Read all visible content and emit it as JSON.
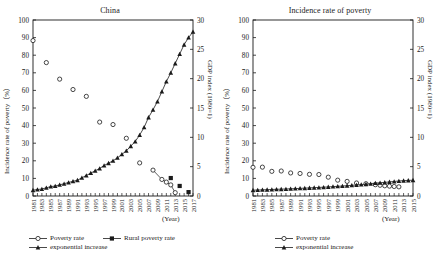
{
  "figure": {
    "background": "#ffffff",
    "axis_color": "#1a1a1a",
    "marker_color": "#1a1a1a"
  },
  "panels": [
    {
      "key": "china",
      "title": "China",
      "x_unit_label": "(Year)",
      "y_left_label": "Incidence rate of poverty（%）",
      "y_right_label": "GDP index (1980=1)",
      "legend": [
        {
          "label": "Poverty rate",
          "marker": "open-circle"
        },
        {
          "label": "Rural poverty rate",
          "marker": "filled-square"
        },
        {
          "label": "exponential increase",
          "marker": "filled-triangle"
        }
      ]
    },
    {
      "key": "incidence",
      "title": "Incidence rate of poverty",
      "x_unit_label": "(Year)",
      "y_left_label": "Incidence rate of poverty（%）",
      "y_right_label": "GDP index (1980=1)",
      "legend": [
        {
          "label": "Poverty rate",
          "marker": "open-circle"
        },
        {
          "label": "exponential increase",
          "marker": "filled-triangle"
        }
      ]
    }
  ],
  "chart_data": [
    {
      "type": "scatter",
      "title": "China",
      "xlabel": "(Year)",
      "ylabel": "Incidence rate of poverty（%）",
      "ylabel_right": "GDP index (1980=1)",
      "ylim": [
        0,
        100
      ],
      "ylim_right": [
        0,
        30
      ],
      "yticks": [
        0,
        10,
        20,
        30,
        40,
        50,
        60,
        70,
        80,
        90,
        100
      ],
      "yticks_right": [
        0,
        5,
        10,
        15,
        20,
        25,
        30
      ],
      "grid": false,
      "legend_position": "below-axes",
      "x": [
        1981,
        1982,
        1983,
        1984,
        1985,
        1986,
        1987,
        1988,
        1989,
        1990,
        1991,
        1992,
        1993,
        1994,
        1995,
        1996,
        1997,
        1998,
        1999,
        2000,
        2001,
        2002,
        2003,
        2004,
        2005,
        2006,
        2007,
        2008,
        2009,
        2010,
        2011,
        2012,
        2013,
        2014,
        2015,
        2016,
        2017
      ],
      "xtick_labels": [
        "1981",
        "1983",
        "1985",
        "1987",
        "1989",
        "1991",
        "1993",
        "1995",
        "1997",
        "1999",
        "2001",
        "2003",
        "2005",
        "2007",
        "2009",
        "2011",
        "2013",
        "2015",
        "2017"
      ],
      "series": [
        {
          "name": "Poverty rate",
          "marker": "open-circle",
          "axis": "left",
          "points": [
            {
              "x": 1981,
              "y": 88.3
            },
            {
              "x": 1984,
              "y": 75.8
            },
            {
              "x": 1987,
              "y": 66.4
            },
            {
              "x": 1990,
              "y": 60.5
            },
            {
              "x": 1993,
              "y": 56.6
            },
            {
              "x": 1996,
              "y": 42.0
            },
            {
              "x": 1999,
              "y": 40.6
            },
            {
              "x": 2002,
              "y": 32.8
            },
            {
              "x": 2005,
              "y": 18.8
            },
            {
              "x": 2008,
              "y": 14.7
            },
            {
              "x": 2010,
              "y": 9.4
            },
            {
              "x": 2011,
              "y": 7.9
            },
            {
              "x": 2012,
              "y": 6.3
            },
            {
              "x": 2013,
              "y": 1.9
            }
          ]
        },
        {
          "name": "Rural poverty rate",
          "marker": "filled-square",
          "axis": "left",
          "points": [
            {
              "x": 2012,
              "y": 10.2
            },
            {
              "x": 2014,
              "y": 5.7
            },
            {
              "x": 2016,
              "y": 2.2
            }
          ]
        },
        {
          "name": "exponential increase",
          "marker": "filled-triangle",
          "axis": "right",
          "points": [
            {
              "x": 1981,
              "y": 1.0
            },
            {
              "x": 1982,
              "y": 1.1
            },
            {
              "x": 1983,
              "y": 1.2
            },
            {
              "x": 1984,
              "y": 1.4
            },
            {
              "x": 1985,
              "y": 1.6
            },
            {
              "x": 1986,
              "y": 1.7
            },
            {
              "x": 1987,
              "y": 1.9
            },
            {
              "x": 1988,
              "y": 2.1
            },
            {
              "x": 1989,
              "y": 2.3
            },
            {
              "x": 1990,
              "y": 2.5
            },
            {
              "x": 1991,
              "y": 2.7
            },
            {
              "x": 1992,
              "y": 3.1
            },
            {
              "x": 1993,
              "y": 3.5
            },
            {
              "x": 1994,
              "y": 3.9
            },
            {
              "x": 1995,
              "y": 4.3
            },
            {
              "x": 1996,
              "y": 4.7
            },
            {
              "x": 1997,
              "y": 5.2
            },
            {
              "x": 1998,
              "y": 5.6
            },
            {
              "x": 1999,
              "y": 6.0
            },
            {
              "x": 2000,
              "y": 6.5
            },
            {
              "x": 2001,
              "y": 7.1
            },
            {
              "x": 2002,
              "y": 7.7
            },
            {
              "x": 2003,
              "y": 8.5
            },
            {
              "x": 2004,
              "y": 9.3
            },
            {
              "x": 2005,
              "y": 10.4
            },
            {
              "x": 2006,
              "y": 11.7
            },
            {
              "x": 2007,
              "y": 13.4
            },
            {
              "x": 2008,
              "y": 14.7
            },
            {
              "x": 2009,
              "y": 16.1
            },
            {
              "x": 2010,
              "y": 17.8
            },
            {
              "x": 2011,
              "y": 19.5
            },
            {
              "x": 2012,
              "y": 21.0
            },
            {
              "x": 2013,
              "y": 22.6
            },
            {
              "x": 2014,
              "y": 24.2
            },
            {
              "x": 2015,
              "y": 25.8
            },
            {
              "x": 2016,
              "y": 27.0
            },
            {
              "x": 2017,
              "y": 28.0
            }
          ]
        }
      ]
    },
    {
      "type": "scatter",
      "title": "Incidence rate of poverty",
      "xlabel": "(Year)",
      "ylabel": "Incidence rate of poverty（%）",
      "ylabel_right": "GDP index (1980=1)",
      "ylim": [
        0,
        100
      ],
      "ylim_right": [
        0,
        30
      ],
      "yticks": [
        0,
        10,
        20,
        30,
        40,
        50,
        60,
        70,
        80,
        90,
        100
      ],
      "yticks_right": [
        0,
        5,
        10,
        15,
        20,
        25,
        30
      ],
      "grid": false,
      "legend_position": "below-axes",
      "x": [
        1981,
        1982,
        1983,
        1984,
        1985,
        1986,
        1987,
        1988,
        1989,
        1990,
        1991,
        1992,
        1993,
        1994,
        1995,
        1996,
        1997,
        1998,
        1999,
        2000,
        2001,
        2002,
        2003,
        2004,
        2005,
        2006,
        2007,
        2008,
        2009,
        2010,
        2011,
        2012,
        2013,
        2014,
        2015
      ],
      "xtick_labels": [
        "1981",
        "1983",
        "1985",
        "1987",
        "1989",
        "1991",
        "1993",
        "1995",
        "1997",
        "1999",
        "2001",
        "2003",
        "2005",
        "2007",
        "2009",
        "2011",
        "2013",
        "2015"
      ],
      "series": [
        {
          "name": "Poverty rate",
          "marker": "open-circle",
          "axis": "left",
          "points": [
            {
              "x": 1981,
              "y": 16.3
            },
            {
              "x": 1983,
              "y": 16.4
            },
            {
              "x": 1985,
              "y": 14.0
            },
            {
              "x": 1987,
              "y": 14.2
            },
            {
              "x": 1989,
              "y": 13.1
            },
            {
              "x": 1991,
              "y": 12.8
            },
            {
              "x": 1993,
              "y": 12.3
            },
            {
              "x": 1995,
              "y": 12.2
            },
            {
              "x": 1997,
              "y": 10.7
            },
            {
              "x": 1999,
              "y": 9.0
            },
            {
              "x": 2001,
              "y": 8.3
            },
            {
              "x": 2003,
              "y": 7.4
            },
            {
              "x": 2005,
              "y": 7.0
            },
            {
              "x": 2007,
              "y": 6.4
            },
            {
              "x": 2008,
              "y": 6.1
            },
            {
              "x": 2009,
              "y": 5.8
            },
            {
              "x": 2010,
              "y": 5.6
            },
            {
              "x": 2011,
              "y": 5.4
            },
            {
              "x": 2012,
              "y": 5.2
            }
          ]
        },
        {
          "name": "exponential increase",
          "marker": "filled-triangle",
          "axis": "right",
          "points": [
            {
              "x": 1981,
              "y": 1.0
            },
            {
              "x": 1982,
              "y": 1.02
            },
            {
              "x": 1983,
              "y": 1.05
            },
            {
              "x": 1984,
              "y": 1.08
            },
            {
              "x": 1985,
              "y": 1.11
            },
            {
              "x": 1986,
              "y": 1.14
            },
            {
              "x": 1987,
              "y": 1.17
            },
            {
              "x": 1988,
              "y": 1.2
            },
            {
              "x": 1989,
              "y": 1.23
            },
            {
              "x": 1990,
              "y": 1.26
            },
            {
              "x": 1991,
              "y": 1.3
            },
            {
              "x": 1992,
              "y": 1.34
            },
            {
              "x": 1993,
              "y": 1.38
            },
            {
              "x": 1994,
              "y": 1.42
            },
            {
              "x": 1995,
              "y": 1.46
            },
            {
              "x": 1996,
              "y": 1.5
            },
            {
              "x": 1997,
              "y": 1.55
            },
            {
              "x": 1998,
              "y": 1.6
            },
            {
              "x": 1999,
              "y": 1.65
            },
            {
              "x": 2000,
              "y": 1.7
            },
            {
              "x": 2001,
              "y": 1.76
            },
            {
              "x": 2002,
              "y": 1.82
            },
            {
              "x": 2003,
              "y": 1.88
            },
            {
              "x": 2004,
              "y": 1.95
            },
            {
              "x": 2005,
              "y": 2.02
            },
            {
              "x": 2006,
              "y": 2.1
            },
            {
              "x": 2007,
              "y": 2.2
            },
            {
              "x": 2008,
              "y": 2.26
            },
            {
              "x": 2009,
              "y": 2.32
            },
            {
              "x": 2010,
              "y": 2.4
            },
            {
              "x": 2011,
              "y": 2.48
            },
            {
              "x": 2012,
              "y": 2.56
            },
            {
              "x": 2013,
              "y": 2.62
            },
            {
              "x": 2014,
              "y": 2.66
            },
            {
              "x": 2015,
              "y": 2.7
            }
          ]
        }
      ]
    }
  ]
}
